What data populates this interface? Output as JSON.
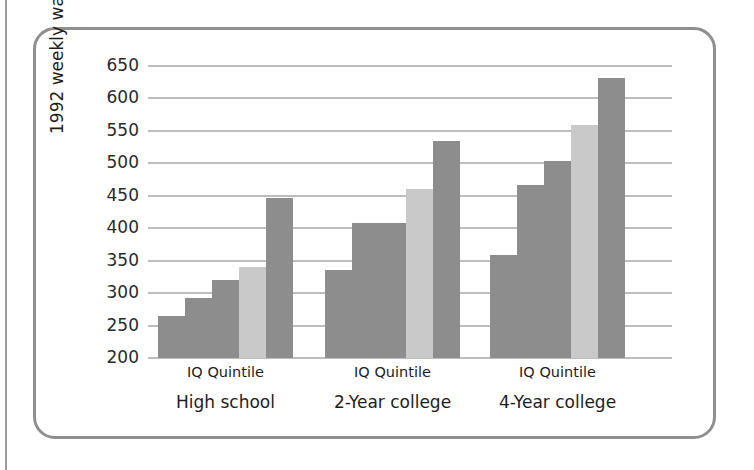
{
  "figure": {
    "y_axis_title": "1992 weekly wages",
    "colors": {
      "bar_default": "#8d8d8d",
      "bar_highlight": "#c9c9c9",
      "gridline": "#bdbdbd",
      "card_border": "#8f8f8f",
      "text": "#1d1d1d",
      "background": "#ffffff"
    }
  },
  "chart_data": {
    "type": "bar",
    "title": "",
    "xlabel": "IQ Quintile",
    "ylabel": "1992 weekly wages",
    "ylim": [
      200,
      650
    ],
    "yticks": [
      200,
      250,
      300,
      350,
      400,
      450,
      500,
      550,
      600,
      650
    ],
    "ytick_labels": [
      "200",
      "250",
      "300",
      "350",
      "400",
      "450",
      "500",
      "550",
      "600",
      "650"
    ],
    "grid": true,
    "legend": "none",
    "categories": [
      "High school",
      "2-Year college",
      "4-Year college"
    ],
    "subcategory_label": "IQ Quintile",
    "subcategories": [
      "Quintile 1",
      "Quintile 2",
      "Quintile 3",
      "Quintile 4",
      "Quintile 5"
    ],
    "groups": [
      {
        "name": "High school",
        "caption": "IQ Quintile",
        "bars": [
          {
            "label": "Quintile 1",
            "value": 265,
            "color": "#8d8d8d"
          },
          {
            "label": "Quintile 2",
            "value": 292,
            "color": "#8d8d8d"
          },
          {
            "label": "Quintile 3",
            "value": 320,
            "color": "#8d8d8d"
          },
          {
            "label": "Quintile 4",
            "value": 340,
            "color": "#c9c9c9"
          },
          {
            "label": "Quintile 5",
            "value": 447,
            "color": "#8d8d8d"
          }
        ]
      },
      {
        "name": "2-Year college",
        "caption": "IQ Quintile",
        "bars": [
          {
            "label": "Quintile 1",
            "value": 336,
            "color": "#8d8d8d"
          },
          {
            "label": "Quintile 2",
            "value": 408,
            "color": "#8d8d8d"
          },
          {
            "label": "Quintile 3",
            "value": 408,
            "color": "#8d8d8d"
          },
          {
            "label": "Quintile 4",
            "value": 460,
            "color": "#c9c9c9"
          },
          {
            "label": "Quintile 5",
            "value": 534,
            "color": "#8d8d8d"
          }
        ]
      },
      {
        "name": "4-Year college",
        "caption": "IQ Quintile",
        "bars": [
          {
            "label": "Quintile 1",
            "value": 358,
            "color": "#8d8d8d"
          },
          {
            "label": "Quintile 2",
            "value": 466,
            "color": "#8d8d8d"
          },
          {
            "label": "Quintile 3",
            "value": 504,
            "color": "#8d8d8d"
          },
          {
            "label": "Quintile 4",
            "value": 559,
            "color": "#c9c9c9"
          },
          {
            "label": "Quintile 5",
            "value": 631,
            "color": "#8d8d8d"
          }
        ]
      }
    ]
  }
}
